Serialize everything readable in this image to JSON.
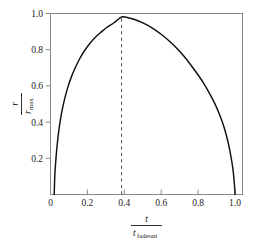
{
  "chart_data": {
    "type": "line",
    "title": "",
    "subtitle": "",
    "xlabel_numerator": "t",
    "xlabel_denominator": "t",
    "xlabel_denominator_sub": "fadeout",
    "ylabel_numerator": "r",
    "ylabel_denominator": "r",
    "ylabel_denominator_sub": "max",
    "xlim": [
      0,
      1.04
    ],
    "ylim": [
      0,
      1.02
    ],
    "grid": false,
    "legend": false,
    "legend_position": "none",
    "xticks": [
      0,
      0.2,
      0.4,
      0.6,
      0.8,
      1.0
    ],
    "xticklabels": [
      "0",
      "0.2",
      "0.4",
      "0.6",
      "0.8",
      "1.0"
    ],
    "yticks": [
      0.2,
      0.4,
      0.6,
      0.8,
      1.0
    ],
    "yticklabels": [
      "0.2",
      "0.4",
      "0.6",
      "0.8",
      "1.0"
    ],
    "curve_color": "#111111",
    "frame_color": "#8a8a8a",
    "annotation_color": "#4c4c4c",
    "annotations": [
      {
        "name": "peak-marker",
        "kind": "vertical-dashed-line",
        "x": 0.385,
        "y_from": 0.0,
        "y_to": 1.0
      }
    ],
    "series": [
      {
        "name": "r/r_max",
        "x": [
          0.02,
          0.024,
          0.03,
          0.038,
          0.048,
          0.06,
          0.075,
          0.092,
          0.112,
          0.134,
          0.158,
          0.184,
          0.212,
          0.242,
          0.274,
          0.308,
          0.344,
          0.385,
          0.42,
          0.456,
          0.494,
          0.532,
          0.57,
          0.608,
          0.646,
          0.684,
          0.722,
          0.76,
          0.796,
          0.83,
          0.862,
          0.89,
          0.916,
          0.938,
          0.956,
          0.97,
          0.981,
          0.989,
          0.995,
          1.0
        ],
        "y": [
          0.0,
          0.118,
          0.208,
          0.298,
          0.382,
          0.46,
          0.532,
          0.598,
          0.66,
          0.714,
          0.765,
          0.81,
          0.85,
          0.885,
          0.915,
          0.944,
          0.968,
          1.0,
          0.996,
          0.986,
          0.97,
          0.95,
          0.925,
          0.896,
          0.862,
          0.824,
          0.78,
          0.73,
          0.679,
          0.626,
          0.568,
          0.512,
          0.45,
          0.386,
          0.32,
          0.256,
          0.192,
          0.136,
          0.074,
          0.0
        ]
      }
    ]
  },
  "axes": {
    "xlabel_numerator": "t",
    "xlabel_denominator": "t",
    "xlabel_denominator_sub": "fadeout",
    "ylabel_numerator": "r",
    "ylabel_denominator": "r",
    "ylabel_denominator_sub": "max"
  }
}
